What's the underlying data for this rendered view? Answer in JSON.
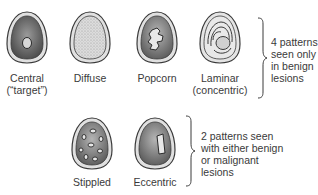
{
  "figure": {
    "row1": {
      "patterns": [
        {
          "id": "central",
          "label_line1": "Central",
          "label_line2": "(“target”)"
        },
        {
          "id": "diffuse",
          "label_line1": "Diffuse",
          "label_line2": ""
        },
        {
          "id": "popcorn",
          "label_line1": "Popcorn",
          "label_line2": ""
        },
        {
          "id": "laminar",
          "label_line1": "Laminar",
          "label_line2": "(concentric)"
        }
      ],
      "note": [
        "4 patterns",
        "seen only",
        "in benign",
        "lesions"
      ]
    },
    "row2": {
      "patterns": [
        {
          "id": "stippled",
          "label_line1": "Stippled"
        },
        {
          "id": "eccentric",
          "label_line1": "Eccentric"
        }
      ],
      "note": [
        "2 patterns seen",
        "with either benign",
        "or malignant",
        "lesions"
      ]
    },
    "colors": {
      "outline": "#3a3a3a",
      "rim_fill": "#d8d8d8",
      "dark_fill": "#6a6a6a",
      "light_fill": "#e6e6e6"
    }
  }
}
